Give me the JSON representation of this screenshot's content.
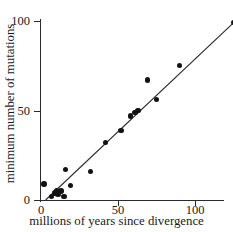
{
  "chart_data": {
    "type": "scatter",
    "title": "",
    "xlabel": "millions of years since divergence",
    "ylabel": "minimum number of mutations",
    "xlim": [
      0,
      130
    ],
    "ylim": [
      0,
      103
    ],
    "xticks": [
      0,
      50,
      100
    ],
    "yticks": [
      0,
      50,
      100
    ],
    "xtick_labels": [
      "0",
      "50",
      "100"
    ],
    "ytick_labels": [
      "0",
      "50",
      "100"
    ],
    "grid": false,
    "legend": null,
    "points": [
      {
        "x": 2,
        "y": 9
      },
      {
        "x": 7,
        "y": 2
      },
      {
        "x": 9,
        "y": 4
      },
      {
        "x": 10,
        "y": 5
      },
      {
        "x": 11,
        "y": 3
      },
      {
        "x": 13,
        "y": 5
      },
      {
        "x": 15,
        "y": 2
      },
      {
        "x": 16,
        "y": 17
      },
      {
        "x": 19,
        "y": 8
      },
      {
        "x": 32,
        "y": 16
      },
      {
        "x": 42,
        "y": 32
      },
      {
        "x": 52,
        "y": 39
      },
      {
        "x": 58,
        "y": 47
      },
      {
        "x": 61,
        "y": 49
      },
      {
        "x": 63,
        "y": 50
      },
      {
        "x": 69,
        "y": 67
      },
      {
        "x": 75,
        "y": 56
      },
      {
        "x": 90,
        "y": 75
      },
      {
        "x": 125,
        "y": 99
      }
    ],
    "fit_line": {
      "type": "linear",
      "x_start": 3,
      "y_start": 0,
      "x_end": 125,
      "y_end": 99
    }
  },
  "axis_titles": {
    "x": "millions of years since divergence",
    "y": "minimum number of mutations"
  },
  "colors": {
    "background": "#ffffff",
    "axis": "#2b2b2b",
    "marker": "#121212",
    "line": "#2b2b2b",
    "text": "#1a1a1a"
  }
}
